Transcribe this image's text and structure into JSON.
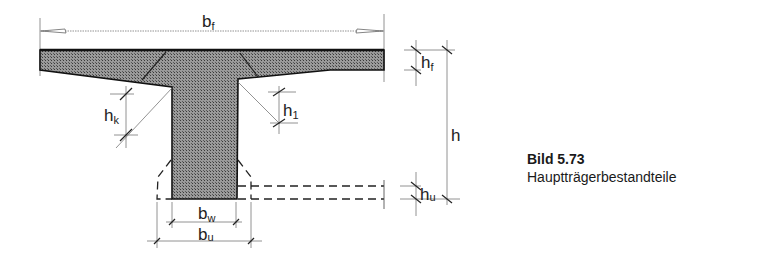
{
  "figure": {
    "type": "t-beam-cross-section",
    "colors": {
      "concrete_fill": "#8c8c8c",
      "outline": "#111111",
      "dimension": "#555555"
    },
    "labels": {
      "flange_width": {
        "main": "b",
        "sub": "f"
      },
      "flange_height": {
        "main": "h",
        "sub": "f"
      },
      "total_height": {
        "main": "h",
        "sub": ""
      },
      "haunch_left": {
        "main": "h",
        "sub": "k"
      },
      "haunch_right": {
        "main": "h",
        "sub": "1"
      },
      "bottom_height": {
        "main": "h",
        "sub": "u"
      },
      "web_width": {
        "main": "b",
        "sub": "w"
      },
      "bottom_width": {
        "main": "b",
        "sub": "u"
      }
    }
  },
  "caption": {
    "title": "Bild 5.73",
    "text": "Hauptträgerbestandteile"
  }
}
